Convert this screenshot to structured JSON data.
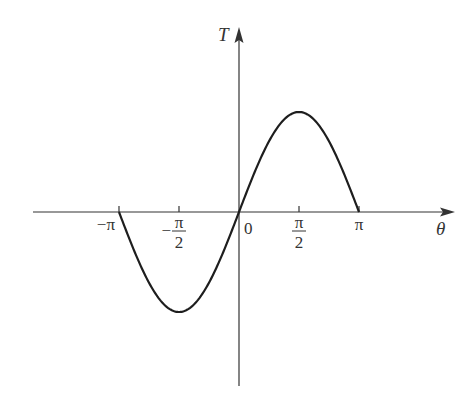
{
  "chart_data": {
    "type": "line",
    "title": "",
    "xlabel": "θ",
    "ylabel": "T",
    "xlim": [
      -4.35,
      4.27
    ],
    "ylim": [
      -3.4,
      3.5
    ],
    "grid": false,
    "legend": "none",
    "x_ticks": [
      {
        "value": -3.14159,
        "label": "−π",
        "fraction": false
      },
      {
        "value": -1.5708,
        "label_sign": "−",
        "numerator": "π",
        "denominator": "2",
        "fraction": true
      },
      {
        "value": 0,
        "label": "0",
        "fraction": false
      },
      {
        "value": 1.5708,
        "label_sign": "",
        "numerator": "π",
        "denominator": "2",
        "fraction": true
      },
      {
        "value": 3.14159,
        "label": "π",
        "fraction": false
      }
    ],
    "series": [
      {
        "name": "T(θ)",
        "function": "sin",
        "amplitude": 1,
        "domain": [
          -3.14159,
          3.14159
        ],
        "peak": {
          "x": 1.5708,
          "y": 1
        },
        "trough": {
          "x": -1.5708,
          "y": -1
        },
        "zeros": [
          -3.14159,
          0,
          3.14159
        ]
      }
    ],
    "colors": {
      "curve": "#1e1e1e",
      "axes": "#333333"
    }
  }
}
